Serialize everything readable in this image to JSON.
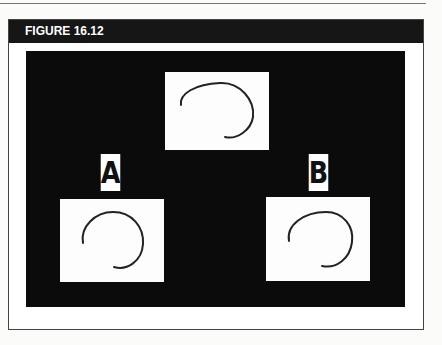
{
  "figure": {
    "title": "FIGURE 16.12",
    "colors": {
      "header_bg": "#161616",
      "panel_bg": "#0b0b0b",
      "card_bg": "#fdfdfd",
      "stroke": "#222222"
    }
  },
  "panel": {
    "target_card": {
      "label": "",
      "shape": "open-circle-arc"
    },
    "choices": [
      {
        "label": "A",
        "shape": "open-circle-arc"
      },
      {
        "label": "B",
        "shape": "open-circle-arc"
      }
    ]
  }
}
